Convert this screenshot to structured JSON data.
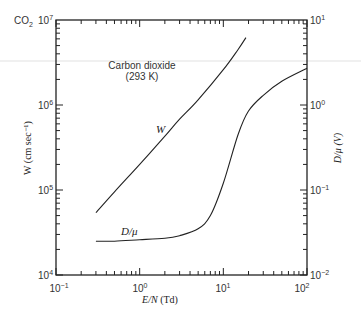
{
  "figure": {
    "corner_label": "CO",
    "corner_label_sub": "2",
    "annotation_line1": "Carbon dioxide",
    "annotation_line2": "(293 K)",
    "curve_label_w": "W",
    "curve_label_d": "D/μ"
  },
  "axes": {
    "x_label_italic": "E/N",
    "x_label_unit": " (Td)",
    "y_left_label": "W (cm sec⁻¹)",
    "y_right_label": "D/μ (V)",
    "x_ticks": [
      {
        "base": "10",
        "exp": "−1"
      },
      {
        "base": "10",
        "exp": "0"
      },
      {
        "base": "10",
        "exp": "1"
      },
      {
        "base": "10",
        "exp": "2"
      }
    ],
    "y_left_ticks": [
      {
        "base": "10",
        "exp": "4"
      },
      {
        "base": "10",
        "exp": "5"
      },
      {
        "base": "10",
        "exp": "6"
      },
      {
        "base": "10",
        "exp": "7"
      }
    ],
    "y_right_ticks": [
      {
        "base": "10",
        "exp": "−2"
      },
      {
        "base": "10",
        "exp": "−1"
      },
      {
        "base": "10",
        "exp": "0"
      },
      {
        "base": "10",
        "exp": "1"
      }
    ]
  },
  "chart_data": {
    "type": "line",
    "title": "Carbon dioxide (293 K)",
    "xlabel": "E/N (Td)",
    "ylabel": "W (cm sec^-1)",
    "y2label": "D/mu (V)",
    "xscale": "log",
    "yscale": "log",
    "y2scale": "log",
    "xlim": [
      0.1,
      100
    ],
    "ylim": [
      10000,
      10000000
    ],
    "y2lim": [
      0.01,
      10
    ],
    "grid": false,
    "legend": "none (inline curve labels)",
    "series": [
      {
        "name": "W",
        "axis": "left",
        "x": [
          0.3,
          0.5,
          1,
          2,
          3,
          5,
          10,
          15,
          18.6
        ],
        "values": [
          54000,
          95000,
          200000,
          430000,
          680000,
          1150000,
          2600000,
          4500000,
          6200000
        ]
      },
      {
        "name": "D/μ",
        "axis": "right",
        "x": [
          0.3,
          0.5,
          1,
          2,
          3,
          5,
          7,
          10,
          15,
          20,
          30,
          50,
          100
        ],
        "values": [
          0.025,
          0.025,
          0.026,
          0.027,
          0.029,
          0.035,
          0.05,
          0.12,
          0.45,
          0.85,
          1.3,
          1.9,
          2.7
        ]
      }
    ]
  }
}
